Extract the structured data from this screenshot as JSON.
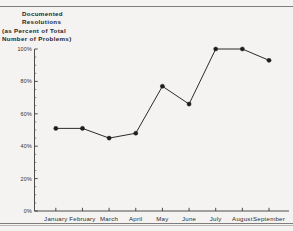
{
  "document": {
    "background_color": "#f4f3f1",
    "rule_color": "#7e7d7b"
  },
  "title": {
    "line1": "Documented",
    "line2": "Resolutions",
    "line3": "(as Percent of Total",
    "line4": "Number of Problems)",
    "full": "Documented Resolutions (as Percent of Total Number of Problems)"
  },
  "chart_data": {
    "type": "line",
    "title": "Documented Resolutions (as Percent of Total Number of Problems)",
    "xlabel": "",
    "ylabel": "",
    "categories": [
      "January",
      "February",
      "March",
      "April",
      "May",
      "June",
      "July",
      "August",
      "September"
    ],
    "values": [
      51,
      51,
      45,
      48,
      77,
      66,
      100,
      100,
      93
    ],
    "series": [
      {
        "name": "Documented Resolutions",
        "values": [
          51,
          51,
          45,
          48,
          77,
          66,
          100,
          100,
          93
        ],
        "line_color": "#2b2b2b",
        "marker_color": "#1d1d1d",
        "marker": "filled-circle"
      }
    ],
    "ylim": [
      0,
      100
    ],
    "ytick_values": [
      0,
      20,
      40,
      60,
      80,
      100
    ],
    "ytick_labels": [
      "0%",
      "20%",
      "40%",
      "60%",
      "80%",
      "100%"
    ],
    "y_minor_tick_step": 5,
    "grid": false,
    "legend": false,
    "legend_position": "none",
    "annotations": []
  }
}
